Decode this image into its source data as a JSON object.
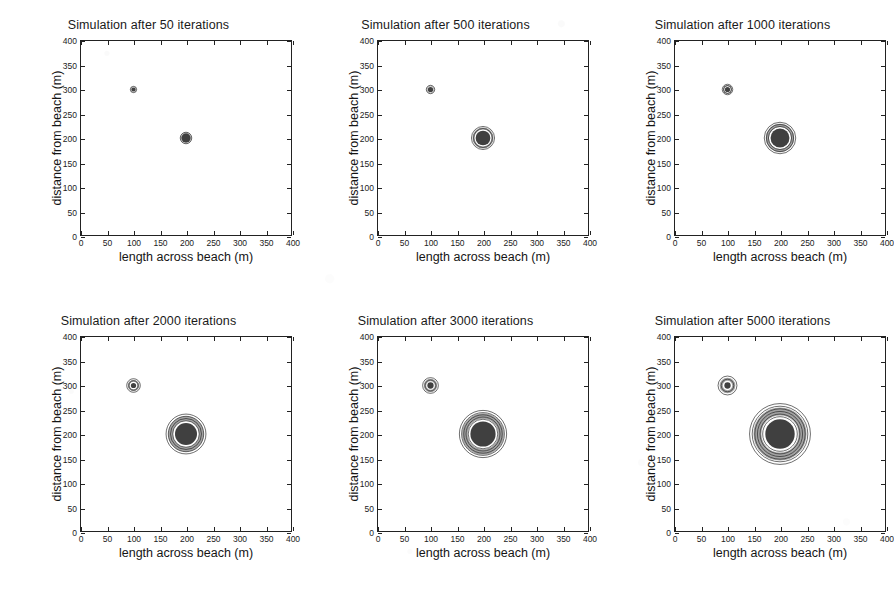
{
  "figure": {
    "kind": "six-panel-contour-figure",
    "background_color": "#ffffff",
    "ink_color": "#1b1b1b"
  },
  "chart_data": [
    {
      "type": "scatter",
      "title": "Simulation after 50 iterations",
      "xlabel": "length across beach (m)",
      "ylabel": "distance from beach (m)",
      "xlim": [
        0,
        400
      ],
      "ylim": [
        0,
        400
      ],
      "xticks": [
        0,
        50,
        100,
        150,
        200,
        250,
        300,
        350,
        400
      ],
      "yticks": [
        0,
        50,
        100,
        150,
        200,
        250,
        300,
        350,
        400
      ],
      "grid": false,
      "legend": "none",
      "iterations": 50,
      "plumes": [
        {
          "name": "minor-source",
          "x": 100,
          "y": 300,
          "radius_m": 6,
          "contour_rings": 1,
          "core_radius_m": 4
        },
        {
          "name": "main-source",
          "x": 200,
          "y": 200,
          "radius_m": 11,
          "contour_rings": 1,
          "core_radius_m": 9
        }
      ]
    },
    {
      "type": "scatter",
      "title": "Simulation after 500 iterations",
      "xlabel": "length across beach (m)",
      "ylabel": "distance from beach (m)",
      "xlim": [
        0,
        400
      ],
      "ylim": [
        0,
        400
      ],
      "xticks": [
        0,
        50,
        100,
        150,
        200,
        250,
        300,
        350,
        400
      ],
      "yticks": [
        0,
        50,
        100,
        150,
        200,
        250,
        300,
        350,
        400
      ],
      "grid": false,
      "legend": "none",
      "iterations": 500,
      "plumes": [
        {
          "name": "minor-source",
          "x": 100,
          "y": 300,
          "radius_m": 8,
          "contour_rings": 1,
          "core_radius_m": 5
        },
        {
          "name": "main-source",
          "x": 200,
          "y": 200,
          "radius_m": 22,
          "contour_rings": 2,
          "core_radius_m": 14
        }
      ]
    },
    {
      "type": "scatter",
      "title": "Simulation after 1000 iterations",
      "xlabel": "length across beach (m)",
      "ylabel": "distance from beach (m)",
      "xlim": [
        0,
        400
      ],
      "ylim": [
        0,
        400
      ],
      "xticks": [
        0,
        50,
        100,
        150,
        200,
        250,
        300,
        350,
        400
      ],
      "yticks": [
        0,
        50,
        100,
        150,
        200,
        250,
        300,
        350,
        400
      ],
      "grid": false,
      "legend": "none",
      "iterations": 1000,
      "plumes": [
        {
          "name": "minor-source",
          "x": 100,
          "y": 300,
          "radius_m": 10,
          "contour_rings": 2,
          "core_radius_m": 5
        },
        {
          "name": "main-source",
          "x": 200,
          "y": 200,
          "radius_m": 30,
          "contour_rings": 3,
          "core_radius_m": 18
        }
      ]
    },
    {
      "type": "scatter",
      "title": "Simulation after 2000 iterations",
      "xlabel": "length across beach (m)",
      "ylabel": "distance from beach (m)",
      "xlim": [
        0,
        400
      ],
      "ylim": [
        0,
        400
      ],
      "xticks": [
        0,
        50,
        100,
        150,
        200,
        250,
        300,
        350,
        400
      ],
      "yticks": [
        0,
        50,
        100,
        150,
        200,
        250,
        300,
        350,
        400
      ],
      "grid": false,
      "legend": "none",
      "iterations": 2000,
      "plumes": [
        {
          "name": "minor-source",
          "x": 100,
          "y": 300,
          "radius_m": 13,
          "contour_rings": 2,
          "core_radius_m": 5
        },
        {
          "name": "main-source",
          "x": 200,
          "y": 200,
          "radius_m": 38,
          "contour_rings": 4,
          "core_radius_m": 21
        }
      ]
    },
    {
      "type": "scatter",
      "title": "Simulation after 3000 iterations",
      "xlabel": "length across beach (m)",
      "ylabel": "distance from beach (m)",
      "xlim": [
        0,
        400
      ],
      "ylim": [
        0,
        400
      ],
      "xticks": [
        0,
        50,
        100,
        150,
        200,
        250,
        300,
        350,
        400
      ],
      "yticks": [
        0,
        50,
        100,
        150,
        200,
        250,
        300,
        350,
        400
      ],
      "grid": false,
      "legend": "none",
      "iterations": 3000,
      "plumes": [
        {
          "name": "minor-source",
          "x": 100,
          "y": 300,
          "radius_m": 15,
          "contour_rings": 2,
          "core_radius_m": 6
        },
        {
          "name": "main-source",
          "x": 200,
          "y": 200,
          "radius_m": 45,
          "contour_rings": 5,
          "core_radius_m": 24
        }
      ]
    },
    {
      "type": "scatter",
      "title": "Simulation after 5000 iterations",
      "xlabel": "length across beach (m)",
      "ylabel": "distance from beach (m)",
      "xlim": [
        0,
        400
      ],
      "ylim": [
        0,
        400
      ],
      "xticks": [
        0,
        50,
        100,
        150,
        200,
        250,
        300,
        350,
        400
      ],
      "yticks": [
        0,
        50,
        100,
        150,
        200,
        250,
        300,
        350,
        400
      ],
      "grid": false,
      "legend": "none",
      "iterations": 5000,
      "plumes": [
        {
          "name": "minor-source",
          "x": 100,
          "y": 300,
          "radius_m": 18,
          "contour_rings": 2,
          "core_radius_m": 6
        },
        {
          "name": "main-source",
          "x": 200,
          "y": 200,
          "radius_m": 58,
          "contour_rings": 6,
          "core_radius_m": 28
        }
      ]
    }
  ]
}
